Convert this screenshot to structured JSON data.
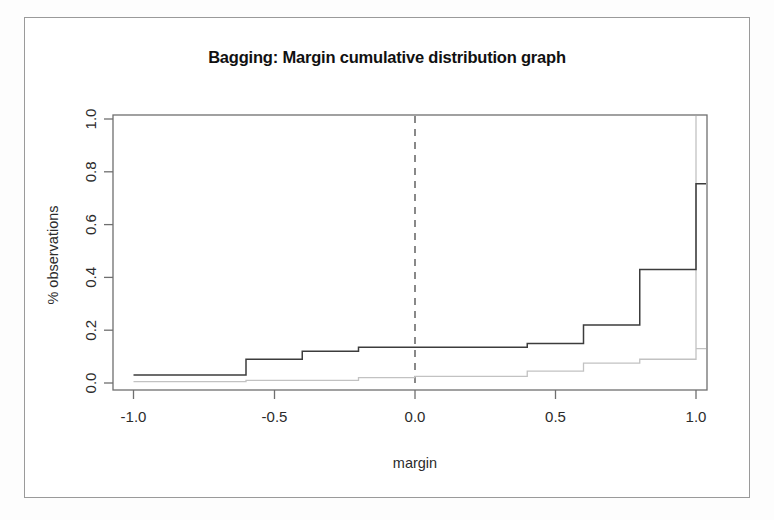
{
  "figure": {
    "title": "Bagging: Margin cumulative distribution graph",
    "xlabel": "margin",
    "ylabel": "% observations"
  },
  "axes": {
    "x_ticks": [
      "-1.0",
      "-0.5",
      "0.0",
      "0.5",
      "1.0"
    ],
    "y_ticks": [
      "0.0",
      "0.2",
      "0.4",
      "0.6",
      "0.8",
      "1.0"
    ]
  },
  "chart_data": {
    "type": "line",
    "subtype": "step-ecdf",
    "title": "Bagging: Margin cumulative distribution graph",
    "xlabel": "margin",
    "ylabel": "% observations",
    "xlim": [
      -1.1,
      1.1
    ],
    "ylim": [
      0.0,
      1.0
    ],
    "xticks": [
      -1.0,
      -0.5,
      0.0,
      0.5,
      1.0
    ],
    "yticks": [
      0.0,
      0.2,
      0.4,
      0.6,
      0.8,
      1.0
    ],
    "grid": false,
    "legend": "none",
    "annotations": [
      {
        "type": "vline",
        "x": 0.0,
        "style": "dashed",
        "label": "margin = 0 reference"
      }
    ],
    "x": [
      -1.0,
      -0.8,
      -0.6,
      -0.4,
      -0.2,
      0.0,
      0.2,
      0.4,
      0.6,
      0.8,
      1.0
    ],
    "series": [
      {
        "name": "train",
        "style": "solid",
        "color": "#3c3c3c",
        "values": [
          0.03,
          0.03,
          0.09,
          0.12,
          0.135,
          0.135,
          0.135,
          0.15,
          0.22,
          0.43,
          0.755
        ]
      },
      {
        "name": "test",
        "style": "dotted",
        "color": "#c2c2c2",
        "values": [
          0.005,
          0.005,
          0.01,
          0.01,
          0.02,
          0.025,
          0.025,
          0.045,
          0.075,
          0.09,
          0.13
        ]
      }
    ]
  }
}
